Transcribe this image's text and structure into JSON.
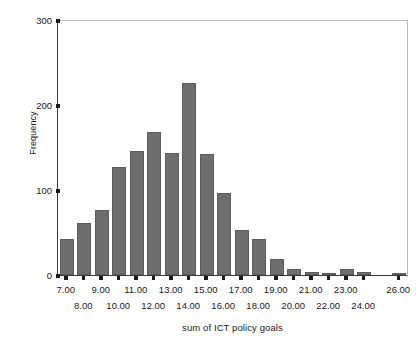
{
  "chart_data": {
    "type": "bar",
    "title": "",
    "xlabel": "sum of ICT policy goals",
    "ylabel": "Frequency",
    "categories": [
      "7.00",
      "8.00",
      "9.00",
      "10.00",
      "11.00",
      "12.00",
      "13.00",
      "14.00",
      "15.00",
      "16.00",
      "17.00",
      "18.00",
      "19.00",
      "20.00",
      "21.00",
      "22.00",
      "23.00",
      "24.00",
      "26.00"
    ],
    "values": [
      42,
      61,
      77,
      127,
      146,
      168,
      143,
      226,
      142,
      97,
      53,
      42,
      19,
      7,
      4,
      2,
      7,
      3,
      1
    ],
    "ylim": [
      0,
      300
    ],
    "yticks": [
      0,
      100,
      200,
      300
    ],
    "ytick_labels": [
      "0",
      "100",
      "200",
      "300"
    ],
    "grid": false,
    "legend": "none",
    "bar_color": "#6e6e6e",
    "axis_color": "#1a1a1a",
    "frame_color": "#b8b8b8"
  }
}
